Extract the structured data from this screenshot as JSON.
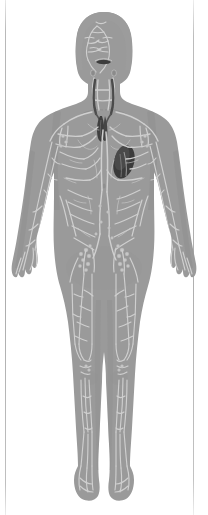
{
  "page": {
    "background_color": "#ffffff",
    "width": 208,
    "height": 515,
    "left_rule_color": "#b0b0b0",
    "right_rule_color": "#b0b0b0"
  },
  "figure": {
    "name": "human-lymphatic-system-female-figure",
    "title": "",
    "orientation": "anterior full-body standing figure",
    "body_fill_color": "#999999",
    "body_shadow_color": "#8c8c8c",
    "vessel_color": "#cfcfcf",
    "node_color": "#c6c6c6",
    "organs": [
      {
        "name": "thymus",
        "color": "#3f3f3f",
        "region": "upper mediastinum, behind sternum"
      },
      {
        "name": "spleen",
        "color": "#3a3a3a",
        "region": "left upper abdomen below diaphragm"
      },
      {
        "name": "thoracic-duct",
        "color": "#4a4a4a",
        "region": "left neck and chest"
      }
    ],
    "node_groups": [
      "cervical",
      "supraclavicular",
      "axillary",
      "mediastinal",
      "abdominal",
      "inguinal",
      "popliteal"
    ],
    "hair_style": "bob",
    "line_art_style": "pale vessel network over flat gray silhouette"
  }
}
